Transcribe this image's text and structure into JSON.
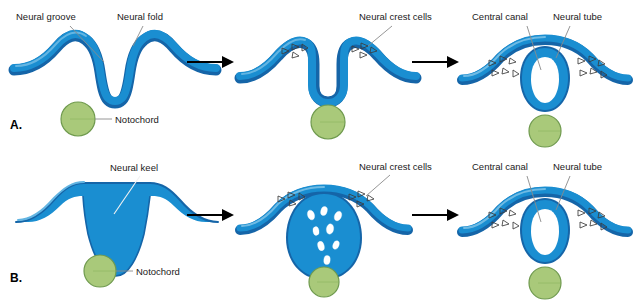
{
  "figure": {
    "background_color": "#ffffff"
  },
  "colors": {
    "ectoderm_blue": "#1a8ed1",
    "ectoderm_blue_dark": "#1565a8",
    "ectoderm_blue_light": "#49a9dd",
    "notochord_green_fill": "#a9c97a",
    "notochord_green_stroke": "#6f9a4e",
    "label_text": "#1a1a1a",
    "leader_line": "#8a8a8a",
    "arrow_black": "#000000",
    "crest_cell_outline": "#3c3c3c",
    "lumen_white": "#ffffff"
  },
  "panels": [
    {
      "id": "panel-a",
      "letter": "A.",
      "mode": "primary-neurulation",
      "stages": [
        {
          "id": "a-stage-1",
          "name": "neural-groove-stage",
          "labels": [
            {
              "key": "neural_groove",
              "text": "Neural groove"
            },
            {
              "key": "neural_fold",
              "text": "Neural fold"
            },
            {
              "key": "notochord",
              "text": "Notochord"
            }
          ]
        },
        {
          "id": "a-stage-2",
          "name": "neural-fold-elevation-stage",
          "labels": [
            {
              "key": "neural_crest_cells",
              "text": "Neural crest cells"
            }
          ]
        },
        {
          "id": "a-stage-3",
          "name": "closed-neural-tube-stage",
          "labels": [
            {
              "key": "central_canal",
              "text": "Central canal"
            },
            {
              "key": "neural_tube",
              "text": "Neural tube"
            }
          ]
        }
      ]
    },
    {
      "id": "panel-b",
      "letter": "B.",
      "mode": "secondary-neurulation",
      "stages": [
        {
          "id": "b-stage-1",
          "name": "neural-keel-stage",
          "labels": [
            {
              "key": "neural_keel",
              "text": "Neural keel"
            },
            {
              "key": "notochord",
              "text": "Notochord"
            }
          ]
        },
        {
          "id": "b-stage-2",
          "name": "cavitation-stage",
          "labels": [
            {
              "key": "neural_crest_cells",
              "text": "Neural crest cells"
            }
          ]
        },
        {
          "id": "b-stage-3",
          "name": "closed-neural-tube-stage",
          "labels": [
            {
              "key": "central_canal",
              "text": "Central canal"
            },
            {
              "key": "neural_tube",
              "text": "Neural tube"
            }
          ]
        }
      ]
    }
  ],
  "labels": {
    "neural_groove": "Neural groove",
    "neural_fold": "Neural fold",
    "neural_crest_cells_a": "Neural crest cells",
    "central_canal_a": "Central canal",
    "neural_tube_a": "Neural tube",
    "notochord_a": "Notochord",
    "panel_a_letter": "A.",
    "neural_keel": "Neural keel",
    "neural_crest_cells_b": "Neural crest cells",
    "central_canal_b": "Central canal",
    "neural_tube_b": "Neural tube",
    "notochord_b": "Notochord",
    "panel_b_letter": "B."
  }
}
